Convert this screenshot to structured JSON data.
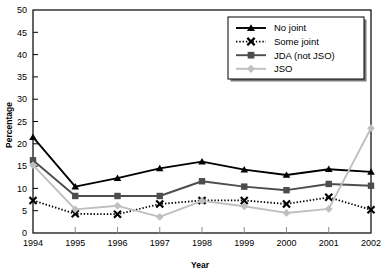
{
  "chart_data": {
    "type": "line",
    "title": "",
    "xlabel": "Year",
    "ylabel": "Percentage",
    "grid": false,
    "legend_position": "top-right",
    "x": [
      1994,
      1995,
      1996,
      1997,
      1998,
      1999,
      2000,
      2001,
      2002
    ],
    "categories": [
      "1994",
      "1995",
      "1996",
      "1997",
      "1998",
      "1999",
      "2000",
      "2001",
      "2002"
    ],
    "xlim": [
      1994,
      2002
    ],
    "ylim": [
      0,
      50
    ],
    "yticks": [
      0,
      5,
      10,
      15,
      20,
      25,
      30,
      35,
      40,
      45,
      50
    ],
    "ytick_labels": [
      "0",
      "5",
      "10",
      "15",
      "20",
      "25",
      "30",
      "35",
      "40",
      "45",
      "50"
    ],
    "xtick_labels": [
      "1994",
      "1995",
      "1996",
      "1997",
      "1998",
      "1999",
      "2000",
      "2001",
      "2002"
    ],
    "series": [
      {
        "name": "No joint",
        "marker": "triangle",
        "line_style": "solid",
        "color": "#000000",
        "values": [
          21.5,
          10.4,
          12.3,
          14.5,
          16.0,
          14.2,
          13.0,
          14.3,
          13.7
        ]
      },
      {
        "name": "Some joint",
        "marker": "x",
        "line_style": "dotted",
        "color": "#000000",
        "values": [
          7.3,
          4.3,
          4.2,
          6.5,
          7.3,
          7.3,
          6.5,
          8.0,
          5.2
        ]
      },
      {
        "name": "JDA (not JSO)",
        "marker": "square",
        "line_style": "solid",
        "color": "#4d4d4d",
        "values": [
          16.3,
          8.3,
          8.3,
          8.3,
          11.6,
          10.4,
          9.6,
          11.0,
          10.6
        ]
      },
      {
        "name": "JSO",
        "marker": "diamond",
        "line_style": "solid",
        "color": "#bfbfbf",
        "values": [
          15.2,
          5.3,
          6.1,
          3.6,
          7.2,
          6.0,
          4.5,
          5.4,
          23.5
        ]
      }
    ]
  },
  "legend": {
    "items": [
      {
        "label": "No joint"
      },
      {
        "label": "Some joint"
      },
      {
        "label": "JDA (not JSO)"
      },
      {
        "label": "JSO"
      }
    ]
  },
  "colors": {
    "no_joint": "#000000",
    "some_joint": "#000000",
    "jda": "#4d4d4d",
    "jso": "#bfbfbf",
    "axis": "#000000",
    "background": "#ffffff"
  }
}
